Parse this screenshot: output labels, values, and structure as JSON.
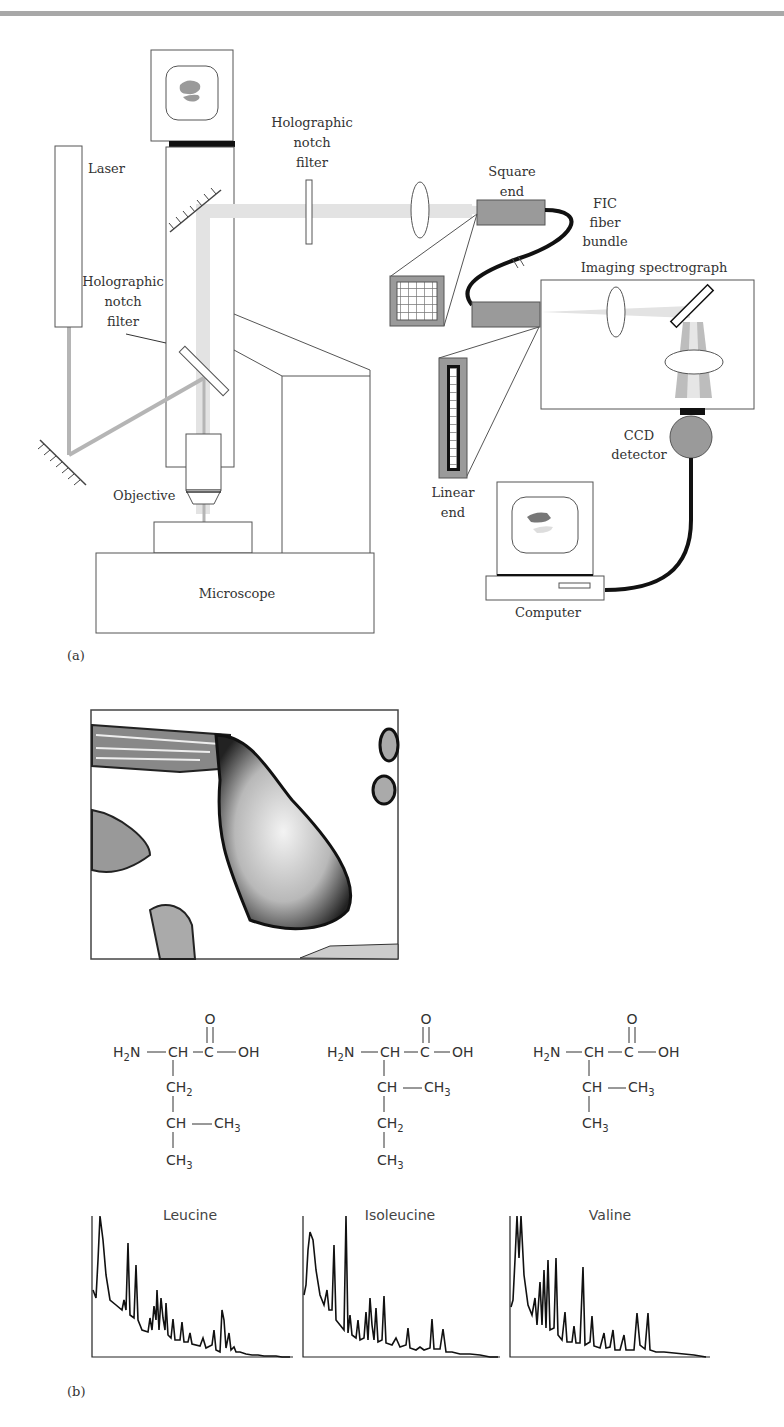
{
  "figure": {
    "panel_a": {
      "label": "(a)",
      "labels": {
        "laser": "Laser",
        "notch_filter_top_1": "Holographic",
        "notch_filter_top_2": "notch",
        "notch_filter_top_3": "filter",
        "notch_filter_side_1": "Holographic",
        "notch_filter_side_2": "notch",
        "notch_filter_side_3": "filter",
        "objective": "Objective",
        "microscope": "Microscope",
        "square_end_1": "Square",
        "square_end_2": "end",
        "fiber_1": "FIC",
        "fiber_2": "fiber",
        "fiber_3": "bundle",
        "spectrograph": "Imaging spectrograph",
        "ccd_1": "CCD",
        "ccd_2": "detector",
        "linear_end_1": "Linear",
        "linear_end_2": "end",
        "computer": "Computer"
      }
    },
    "panel_b": {
      "label": "(b)",
      "micrograph": "microscope-image-of-crystals",
      "structures": [
        {
          "name": "Leucine",
          "rows": [
            "O",
            "H2N—CH—C—OH",
            "CH2",
            "CH—CH3",
            "CH3"
          ]
        },
        {
          "name": "Isoleucine",
          "rows": [
            "O",
            "H2N—CH—C—OH",
            "CH—CH3",
            "CH2",
            "CH3"
          ]
        },
        {
          "name": "Valine",
          "rows": [
            "O",
            "H2N—CH—C—OH",
            "CH—CH3",
            "CH3"
          ]
        }
      ],
      "spectra_titles": [
        "Leucine",
        "Isoleucine",
        "Valine"
      ]
    }
  },
  "text": {
    "o": "O",
    "h": "H",
    "n": "N",
    "c": "C",
    "oh": "OH",
    "ch": "CH",
    "two": "2",
    "three": "3"
  },
  "colors": {
    "line": "#444444",
    "beam": "#e3e3e3",
    "laser_beam": "#b5b5b5",
    "gray_block": "#9a9a9a",
    "topbar": "#a8a8a8"
  }
}
